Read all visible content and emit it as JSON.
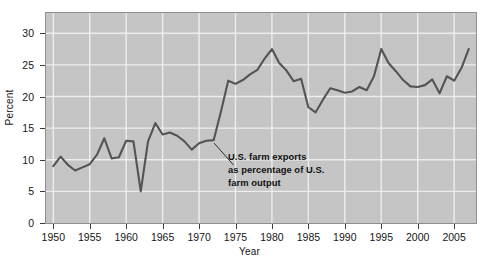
{
  "chart_data": {
    "type": "line",
    "title": "",
    "subtitle": "",
    "xlabel": "Year",
    "ylabel": "Percent",
    "xlim": [
      1949,
      2008
    ],
    "ylim": [
      0,
      33.2
    ],
    "grid": true,
    "legend_position": "none",
    "y_ticks": [
      0,
      5,
      10,
      15,
      20,
      25,
      30
    ],
    "y_tick_labels": [
      "0",
      "5",
      "10",
      "15",
      "20",
      "25",
      "30"
    ],
    "x_ticks": [
      1950,
      1955,
      1960,
      1965,
      1970,
      1975,
      1980,
      1985,
      1990,
      1995,
      2000,
      2005
    ],
    "x_tick_labels": [
      "1950",
      "1955",
      "1960",
      "1965",
      "1970",
      "1975",
      "1980",
      "1985",
      "1990",
      "1995",
      "2000",
      "2005"
    ],
    "series": [
      {
        "name": "U.S. farm exports as percentage of U.S. farm output",
        "color": "#545454",
        "x": [
          1950,
          1951,
          1952,
          1953,
          1954,
          1955,
          1956,
          1957,
          1958,
          1959,
          1960,
          1961,
          1962,
          1963,
          1964,
          1965,
          1966,
          1967,
          1968,
          1969,
          1970,
          1971,
          1972,
          1973,
          1974,
          1975,
          1976,
          1977,
          1978,
          1979,
          1980,
          1981,
          1982,
          1983,
          1984,
          1985,
          1986,
          1987,
          1988,
          1989,
          1990,
          1991,
          1992,
          1993,
          1994,
          1995,
          1996,
          1997,
          1998,
          1999,
          2000,
          2001,
          2002,
          2003,
          2004,
          2005,
          2006,
          2007
        ],
        "y": [
          9.0,
          10.5,
          9.2,
          8.3,
          8.8,
          9.3,
          10.8,
          13.4,
          10.2,
          10.4,
          13.0,
          12.9,
          5.0,
          12.9,
          15.8,
          14.0,
          14.3,
          13.8,
          12.9,
          11.6,
          12.6,
          13.0,
          13.1,
          17.6,
          22.5,
          22.0,
          22.6,
          23.5,
          24.2,
          26.0,
          27.5,
          25.3,
          24.1,
          22.4,
          22.8,
          18.3,
          17.5,
          19.5,
          21.3,
          21.0,
          20.6,
          20.8,
          21.5,
          21.0,
          23.2,
          27.5,
          25.3,
          24.0,
          22.6,
          21.6,
          21.5,
          21.8,
          22.7,
          20.5,
          23.2,
          22.5,
          24.5,
          27.5
        ]
      }
    ],
    "annotations": [
      {
        "name": "series-callout",
        "lines": [
          "U.S. farm exports",
          "as percentage of U.S.",
          "farm output"
        ],
        "points_to_x": 1972,
        "points_to_y": 13.1
      }
    ],
    "colors": {
      "plot_background": "#c9c9c9",
      "gridline": "#f0f0f0",
      "line": "#545454",
      "axis": "#3c3c3c",
      "text": "#161616",
      "page_background": "#ffffff"
    }
  },
  "axes": {
    "y_title": "Percent",
    "x_title": "Year"
  },
  "callout": {
    "line1": "U.S. farm exports",
    "line2": "as percentage of U.S.",
    "line3": "farm output"
  },
  "yticks": [
    {
      "label": "30"
    },
    {
      "label": "25"
    },
    {
      "label": "20"
    },
    {
      "label": "15"
    },
    {
      "label": "10"
    },
    {
      "label": "5"
    },
    {
      "label": "0"
    }
  ],
  "xticks": [
    {
      "label": "1950"
    },
    {
      "label": "1955"
    },
    {
      "label": "1960"
    },
    {
      "label": "1965"
    },
    {
      "label": "1970"
    },
    {
      "label": "1975"
    },
    {
      "label": "1980"
    },
    {
      "label": "1985"
    },
    {
      "label": "1990"
    },
    {
      "label": "1995"
    },
    {
      "label": "2000"
    },
    {
      "label": "2005"
    }
  ]
}
